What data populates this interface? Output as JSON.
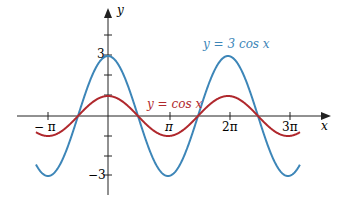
{
  "chart_data": {
    "type": "line",
    "title": "",
    "xlabel": "x",
    "ylabel": "y",
    "xlim": [
      -3.5,
      3.3
    ],
    "ylim": [
      -3.9,
      3.9
    ],
    "x_ticks": [
      "-π",
      "π",
      "2π",
      "3π"
    ],
    "y_ticks": [
      "3",
      "-3"
    ],
    "series": [
      {
        "name": "y = 3 cos x",
        "function": "3*cos(x)",
        "color": "#3d86b8",
        "amplitude": 3
      },
      {
        "name": "y = cos x",
        "function": "cos(x)",
        "color": "#b0282d",
        "amplitude": 1
      }
    ],
    "x_range_pi": [
      -1.2,
      3.2
    ],
    "grid": false
  },
  "labels": {
    "y_axis": "y",
    "x_axis": "x",
    "tick_neg_pi": "− π",
    "tick_pi": "π",
    "tick_2pi": "2π",
    "tick_3pi": "3π",
    "tick_3": "3",
    "tick_neg3": "−3",
    "legend_3cos": "y = 3 cos x",
    "legend_cos": "y = cos x"
  }
}
